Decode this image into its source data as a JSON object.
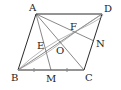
{
  "figure": {
    "type": "parallelogram geometry figure",
    "points": {
      "A": {
        "label": "A",
        "x": 36,
        "y": 14
      },
      "B": {
        "label": "B",
        "x": 18,
        "y": 70
      },
      "C": {
        "label": "C",
        "x": 84,
        "y": 70
      },
      "D": {
        "label": "D",
        "x": 102,
        "y": 14
      },
      "M": {
        "label": "M",
        "x": 51,
        "y": 70
      },
      "O": {
        "label": "O",
        "x": 60,
        "y": 42
      },
      "E": {
        "label": "E",
        "x": 46,
        "y": 51
      },
      "F": {
        "label": "F",
        "x": 74,
        "y": 32
      },
      "N": {
        "label": "N",
        "x": 94,
        "y": 41
      }
    },
    "segments": [
      "AB",
      "BC",
      "CD",
      "DA",
      "AC",
      "BD",
      "AM",
      "AN"
    ],
    "equal_marks": [
      "BM",
      "MC"
    ],
    "curves": [
      "B-E-F-D arc"
    ]
  }
}
